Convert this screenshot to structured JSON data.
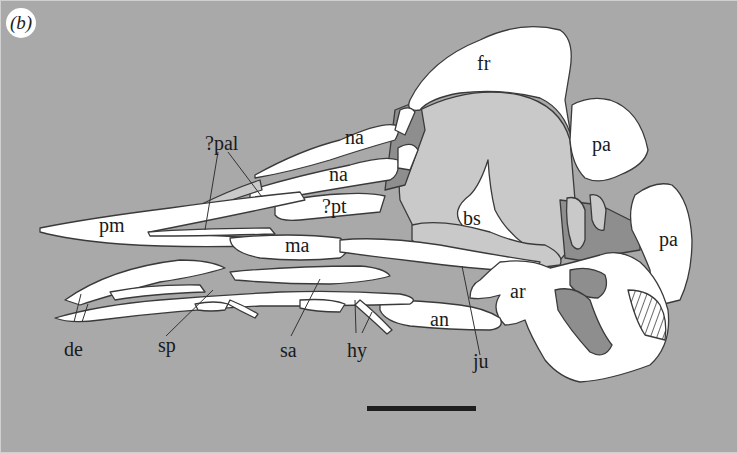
{
  "figure": {
    "panel_label": "(b)",
    "background_color": "#a9a9a9",
    "bone_color": "#ffffff",
    "matrix_light_color": "#c9c9c9",
    "matrix_dark_color": "#8e8e8e",
    "outline_color": "#3a3a3a"
  },
  "labels": {
    "fr": "fr",
    "pa_upper": "pa",
    "pa_lower": "pa",
    "na_upper": "na",
    "na_lower": "na",
    "pal": "?pal",
    "pt": "?pt",
    "bs": "bs",
    "pm": "pm",
    "ma": "ma",
    "ar": "ar",
    "an": "an",
    "de": "de",
    "sp": "sp",
    "sa": "sa",
    "hy": "hy",
    "ju": "ju"
  },
  "scale_bar": {
    "visible": true,
    "color": "#1e1e1e"
  }
}
